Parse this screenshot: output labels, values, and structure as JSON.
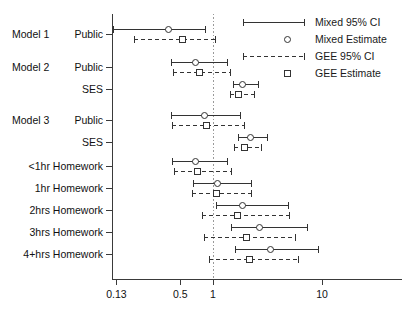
{
  "chart_data": {
    "type": "scatter",
    "plot_kind": "forest-plot",
    "title": "",
    "xlabel": "",
    "ylabel": "",
    "xscale": "log",
    "xlim": [
      0.105,
      26
    ],
    "xticks": [
      0.13,
      0.5,
      1,
      10
    ],
    "xtick_labels": [
      "0.13",
      "0.5",
      "1",
      "10"
    ],
    "reference_line": 1,
    "grid": false,
    "legend_position": "top-right",
    "group_labels": [
      {
        "text": "Model 1",
        "row": "Public"
      },
      {
        "text": "Model 2",
        "row": "Public"
      },
      {
        "text": "Model 3",
        "row": "Public"
      }
    ],
    "categories": [
      "Public",
      "Public",
      "SES",
      "Public",
      "SES",
      "<1hr Homework",
      "1hr Homework",
      "2hrs Homework",
      "3hrs Homework",
      "4+hrs Homework"
    ],
    "series": [
      {
        "name": "Mixed Estimate",
        "ci_name": "Mixed 95% CI",
        "marker": "circle",
        "line_style": "solid",
        "values": [
          0.39,
          0.69,
          1.86,
          0.83,
          2.19,
          0.68,
          1.1,
          1.87,
          2.65,
          3.35
        ],
        "ci_lower": [
          0.12,
          0.41,
          1.52,
          0.41,
          1.68,
          0.42,
          0.65,
          1.07,
          1.46,
          1.58
        ],
        "ci_upper": [
          0.84,
          1.35,
          2.6,
          1.77,
          3.15,
          1.35,
          2.25,
          4.85,
          7.3,
          9.2
        ]
      },
      {
        "name": "GEE Estimate",
        "ci_name": "GEE 95% CI",
        "marker": "square",
        "line_style": "dashed",
        "values": [
          0.52,
          0.74,
          1.72,
          0.87,
          1.93,
          0.72,
          1.07,
          1.65,
          2.01,
          2.14
        ],
        "ci_lower": [
          0.19,
          0.43,
          1.43,
          0.42,
          1.56,
          0.44,
          0.64,
          0.79,
          0.82,
          0.92
        ],
        "ci_upper": [
          1.05,
          1.43,
          2.4,
          1.94,
          2.76,
          1.45,
          2.25,
          4.95,
          5.6,
          6.05
        ]
      }
    ]
  },
  "legend": {
    "items": [
      {
        "label": "Mixed 95% CI",
        "key": "solid-ci-icon"
      },
      {
        "label": "Mixed Estimate",
        "key": "circle-marker-icon"
      },
      {
        "label": "GEE 95% CI",
        "key": "dashed-ci-icon"
      },
      {
        "label": "GEE Estimate",
        "key": "square-marker-icon"
      }
    ]
  }
}
